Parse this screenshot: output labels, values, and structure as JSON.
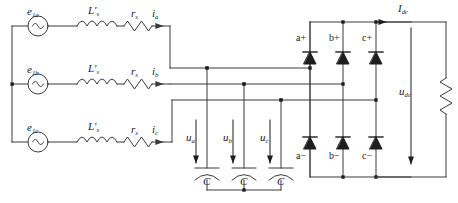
{
  "diagram": {
    "line_color": "#3a3a3a",
    "text_color": "#222222"
  },
  "sources": [
    {
      "name": "source-phase-a",
      "base": "e",
      "sub": "1a",
      "icon": "ac-source-icon"
    },
    {
      "name": "source-phase-b",
      "base": "e",
      "sub": "1b",
      "icon": "ac-source-icon"
    },
    {
      "name": "source-phase-c",
      "base": "e",
      "sub": "1c",
      "icon": "ac-source-icon"
    }
  ],
  "inductors": [
    {
      "name": "inductor-phase-a",
      "base": "L'",
      "sub": "s",
      "icon": "inductor-icon"
    },
    {
      "name": "inductor-phase-b",
      "base": "L'",
      "sub": "s",
      "icon": "inductor-icon"
    },
    {
      "name": "inductor-phase-c",
      "base": "L'",
      "sub": "s",
      "icon": "inductor-icon"
    }
  ],
  "resistors": [
    {
      "name": "resistor-phase-a",
      "base": "r",
      "sub": "s",
      "icon": "resistor-icon"
    },
    {
      "name": "resistor-phase-b",
      "base": "r",
      "sub": "s",
      "icon": "resistor-icon"
    },
    {
      "name": "resistor-phase-c",
      "base": "r",
      "sub": "s",
      "icon": "resistor-icon"
    }
  ],
  "line_currents": [
    {
      "name": "current-phase-a",
      "base": "i",
      "sub": "a",
      "icon": "current-arrow-icon"
    },
    {
      "name": "current-phase-b",
      "base": "i",
      "sub": "b",
      "icon": "current-arrow-icon"
    },
    {
      "name": "current-phase-c",
      "base": "i",
      "sub": "c",
      "icon": "current-arrow-icon"
    }
  ],
  "filter": {
    "voltages": [
      {
        "name": "voltage-ua",
        "base": "u",
        "sub": "a",
        "icon": "voltage-arrow-icon"
      },
      {
        "name": "voltage-ub",
        "base": "u",
        "sub": "b",
        "icon": "voltage-arrow-icon"
      },
      {
        "name": "voltage-uc",
        "base": "u",
        "sub": "c",
        "icon": "voltage-arrow-icon"
      }
    ],
    "capacitors": [
      {
        "name": "capacitor-a",
        "label": "C",
        "icon": "capacitor-icon"
      },
      {
        "name": "capacitor-b",
        "label": "C",
        "icon": "capacitor-icon"
      },
      {
        "name": "capacitor-c",
        "label": "C",
        "icon": "capacitor-icon"
      }
    ]
  },
  "bridge": {
    "upper_diodes": [
      {
        "name": "diode-a-plus",
        "label": "a+",
        "icon": "diode-icon"
      },
      {
        "name": "diode-b-plus",
        "label": "b+",
        "icon": "diode-icon"
      },
      {
        "name": "diode-c-plus",
        "label": "c+",
        "icon": "diode-icon"
      }
    ],
    "lower_diodes": [
      {
        "name": "diode-a-minus",
        "label": "a−",
        "icon": "diode-icon"
      },
      {
        "name": "diode-b-minus",
        "label": "b−",
        "icon": "diode-icon"
      },
      {
        "name": "diode-c-minus",
        "label": "c−",
        "icon": "diode-icon"
      }
    ]
  },
  "dc_side": {
    "current": {
      "name": "dc-current",
      "base": "I",
      "sub": "dc",
      "icon": "current-arrow-icon"
    },
    "voltage": {
      "name": "dc-voltage",
      "base": "u",
      "sub": "dc",
      "icon": "voltage-arrow-icon"
    },
    "load": {
      "name": "dc-load-resistor",
      "icon": "resistor-icon"
    }
  }
}
